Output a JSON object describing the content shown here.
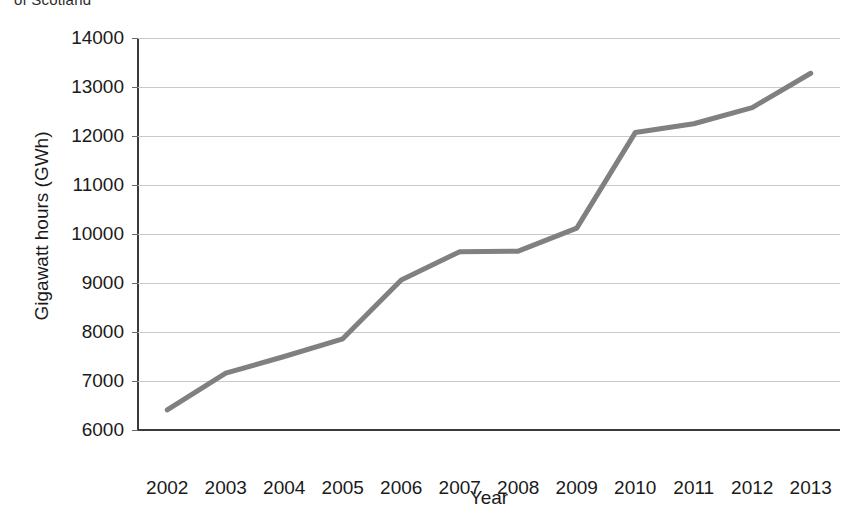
{
  "caption_fragment": "of Scotland",
  "chart_data": {
    "type": "line",
    "title": "",
    "xlabel": "Year",
    "ylabel": "Gigawatt hours (GWh)",
    "categories": [
      "2002",
      "2003",
      "2004",
      "2005",
      "2006",
      "2007",
      "2008",
      "2009",
      "2010",
      "2011",
      "2012",
      "2013"
    ],
    "x": [
      2002,
      2003,
      2004,
      2005,
      2006,
      2007,
      2008,
      2009,
      2010,
      2011,
      2012,
      2013
    ],
    "series": [
      {
        "name": "Gigawatt hours (GWh)",
        "color": "#808080",
        "values": [
          6410,
          7160,
          7500,
          7860,
          9060,
          9640,
          9650,
          10120,
          12070,
          12250,
          12580,
          13280
        ]
      }
    ],
    "ylim": [
      6000,
      14000
    ],
    "ytick_labels": [
      "6000",
      "7000",
      "8000",
      "9000",
      "10000",
      "11000",
      "12000",
      "13000",
      "14000"
    ],
    "yticks": [
      6000,
      7000,
      8000,
      9000,
      10000,
      11000,
      12000,
      13000,
      14000
    ],
    "grid": true,
    "grid_axis": "y",
    "legend": "none",
    "line_color": "#808080",
    "line_width": 5,
    "markers": "none",
    "background": "#ffffff",
    "axis_color": "#3a3a3a",
    "gridline_color": "#c9c9c9"
  }
}
